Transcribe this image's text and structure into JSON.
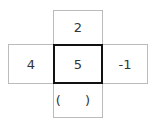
{
  "diagram": {
    "type": "cross-grid",
    "cells": {
      "top": "2",
      "left": "4",
      "center": "5",
      "right": "-1",
      "bottom": "( )"
    },
    "colors": {
      "center_border": "#111111",
      "outer_border": "#bbbbbb",
      "text": "#333333"
    }
  }
}
